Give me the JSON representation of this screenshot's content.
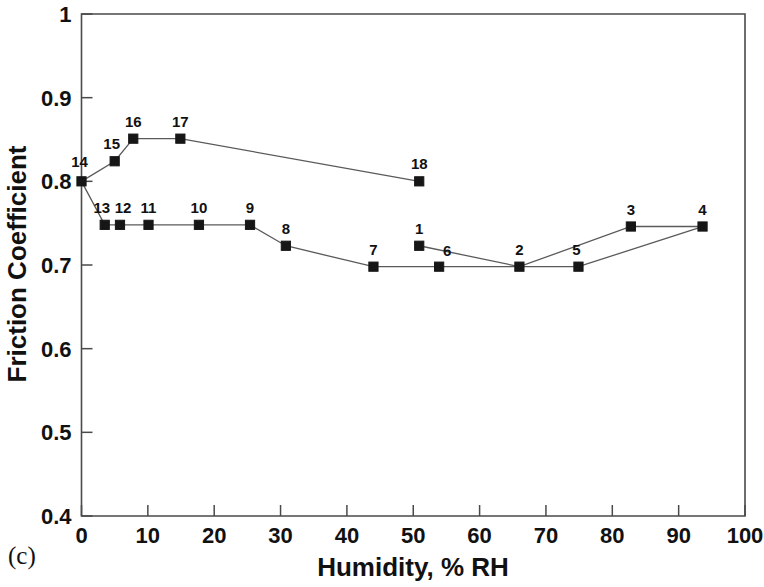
{
  "figure": {
    "panel_label": "(c)",
    "background_color": "#ffffff",
    "marker_color": "#161616",
    "line_color": "#5a5a5a",
    "axis_color": "#4a4a4a"
  },
  "chart_data": {
    "type": "line",
    "title": "",
    "xlabel": "Humidity, % RH",
    "ylabel": "Friction Coefficient",
    "xlim": [
      0,
      100
    ],
    "ylim": [
      0.4,
      1.0
    ],
    "xticks": [
      0,
      10,
      20,
      30,
      40,
      50,
      60,
      70,
      80,
      90,
      100
    ],
    "xtick_labels": [
      "0",
      "10",
      "20",
      "30",
      "40",
      "50",
      "60",
      "70",
      "80",
      "90",
      "100"
    ],
    "yticks": [
      0.4,
      0.5,
      0.6,
      0.7,
      0.8,
      0.9,
      1.0
    ],
    "ytick_labels": [
      "0.4",
      "0.5",
      "0.6",
      "0.7",
      "0.8",
      "0.9",
      "1"
    ],
    "grid": false,
    "legend": false,
    "marker": "square",
    "series": [
      {
        "name": "lower-branch",
        "points": [
          {
            "label": "14",
            "x": 0.0,
            "y": 0.8,
            "label_dx": -2,
            "label_dy": -14
          },
          {
            "label": "13",
            "x": 3.5,
            "y": 0.748,
            "label_dx": -3,
            "label_dy": -12
          },
          {
            "label": "12",
            "x": 5.8,
            "y": 0.748,
            "label_dx": 3,
            "label_dy": -12
          },
          {
            "label": "11",
            "x": 10.1,
            "y": 0.748,
            "label_dx": 0,
            "label_dy": -12
          },
          {
            "label": "10",
            "x": 17.7,
            "y": 0.748,
            "label_dx": 0,
            "label_dy": -12
          },
          {
            "label": "9",
            "x": 25.4,
            "y": 0.748,
            "label_dx": 0,
            "label_dy": -12
          },
          {
            "label": "8",
            "x": 30.8,
            "y": 0.723,
            "label_dx": 0,
            "label_dy": -12
          },
          {
            "label": "7",
            "x": 44.0,
            "y": 0.698,
            "label_dx": 0,
            "label_dy": -12
          },
          {
            "label": "6",
            "x": 53.9,
            "y": 0.698,
            "label_dx": 8,
            "label_dy": -11
          },
          {
            "label": "2",
            "x": 66.0,
            "y": 0.698,
            "label_dx": 0,
            "label_dy": -12
          },
          {
            "label": "5",
            "x": 74.9,
            "y": 0.698,
            "label_dx": -2,
            "label_dy": -12
          },
          {
            "label": "4",
            "x": 93.6,
            "y": 0.746,
            "label_dx": 0,
            "label_dy": -12
          }
        ]
      },
      {
        "name": "upper-branch",
        "points": [
          {
            "label": "14",
            "x": 0.0,
            "y": 0.8,
            "label_dx": -2,
            "label_dy": -14
          },
          {
            "label": "15",
            "x": 5.0,
            "y": 0.824,
            "label_dx": -3,
            "label_dy": -12
          },
          {
            "label": "16",
            "x": 7.8,
            "y": 0.851,
            "label_dx": 0,
            "label_dy": -12
          },
          {
            "label": "17",
            "x": 14.9,
            "y": 0.851,
            "label_dx": 0,
            "label_dy": -12
          },
          {
            "label": "18",
            "x": 50.9,
            "y": 0.8,
            "label_dx": 0,
            "label_dy": -12
          }
        ]
      },
      {
        "name": "mid-connector",
        "points": [
          {
            "label": "1",
            "x": 50.9,
            "y": 0.723,
            "label_dx": 0,
            "label_dy": -12
          },
          {
            "label": "2",
            "x": 66.0,
            "y": 0.698,
            "label_dx": 0,
            "label_dy": -12
          },
          {
            "label": "3",
            "x": 82.8,
            "y": 0.746,
            "label_dx": 0,
            "label_dy": -12
          },
          {
            "label": "4",
            "x": 93.6,
            "y": 0.746,
            "label_dx": 0,
            "label_dy": -12
          }
        ]
      }
    ],
    "annotations": [
      {
        "text": "1",
        "x": 50.9,
        "y": 0.723
      },
      {
        "text": "2",
        "x": 66.0,
        "y": 0.698
      },
      {
        "text": "3",
        "x": 82.8,
        "y": 0.746
      },
      {
        "text": "4",
        "x": 93.6,
        "y": 0.746
      },
      {
        "text": "5",
        "x": 74.9,
        "y": 0.698
      },
      {
        "text": "6",
        "x": 53.9,
        "y": 0.698
      },
      {
        "text": "7",
        "x": 44.0,
        "y": 0.698
      },
      {
        "text": "8",
        "x": 30.8,
        "y": 0.723
      },
      {
        "text": "9",
        "x": 25.4,
        "y": 0.748
      },
      {
        "text": "10",
        "x": 17.7,
        "y": 0.748
      },
      {
        "text": "11",
        "x": 10.1,
        "y": 0.748
      },
      {
        "text": "12",
        "x": 5.8,
        "y": 0.748
      },
      {
        "text": "13",
        "x": 3.5,
        "y": 0.748
      },
      {
        "text": "14",
        "x": 0.0,
        "y": 0.8
      },
      {
        "text": "15",
        "x": 5.0,
        "y": 0.824
      },
      {
        "text": "16",
        "x": 7.8,
        "y": 0.851
      },
      {
        "text": "17",
        "x": 14.9,
        "y": 0.851
      },
      {
        "text": "18",
        "x": 50.9,
        "y": 0.8
      }
    ]
  }
}
